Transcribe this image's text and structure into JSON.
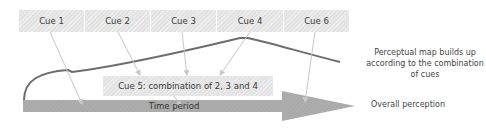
{
  "cues": [
    {
      "label": "Cue 1"
    },
    {
      "label": "Cue 2"
    },
    {
      "label": "Cue 3"
    },
    {
      "label": "Cue 4"
    },
    {
      "label": "Cue 6"
    }
  ],
  "combined_cue": {
    "label": "Cue 5: combination of 2, 3 and 4"
  },
  "timeline": {
    "label": "Time period"
  },
  "annotations": {
    "perceptual_map": "Perceptual map builds up according to the combination of cues",
    "outcome": "Overall perception"
  },
  "colors": {
    "cue_box": "#e3e3e3",
    "arrow_body": "#a8a8a8",
    "curve": "#6e6e6e",
    "connector": "#c8c8c8"
  }
}
